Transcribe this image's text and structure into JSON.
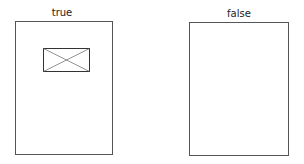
{
  "panels": [
    {
      "label": "true",
      "has_placeholder": true
    },
    {
      "label": "false",
      "has_placeholder": false
    }
  ],
  "colors": {
    "stroke": "#555555",
    "text": "#222222",
    "background": "#ffffff"
  }
}
